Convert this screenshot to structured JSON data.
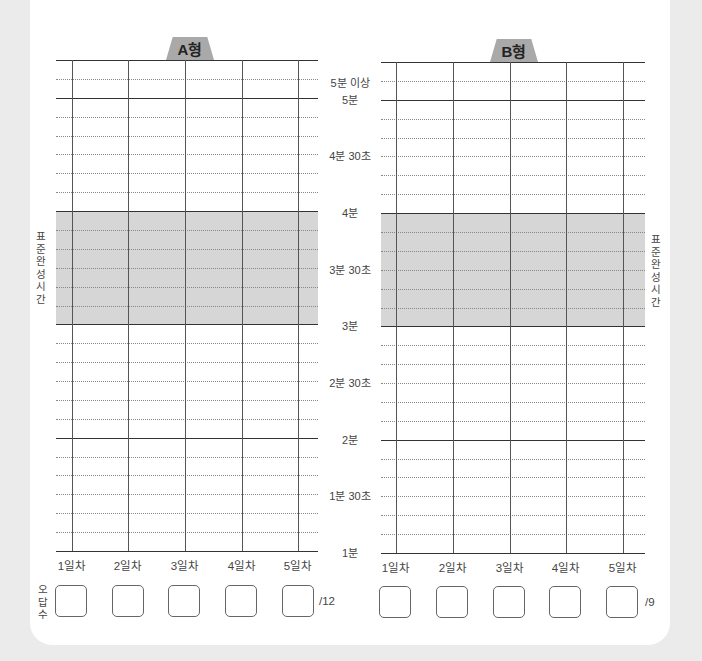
{
  "charts": [
    {
      "id": "A",
      "tab_label": "A형",
      "total_label": "/12",
      "day_labels": [
        "1일차",
        "2일차",
        "3일차",
        "4일차",
        "5일차"
      ],
      "answer_boxes": [
        "",
        "",
        "",
        "",
        ""
      ]
    },
    {
      "id": "B",
      "tab_label": "B형",
      "total_label": "/9",
      "day_labels": [
        "1일차",
        "2일차",
        "3일차",
        "4일차",
        "5일차"
      ],
      "answer_boxes": [
        "",
        "",
        "",
        "",
        ""
      ]
    }
  ],
  "y_labels": [
    "5분 이상",
    "5분",
    "4분 30초",
    "4분",
    "3분 30초",
    "3분",
    "2분 30초",
    "2분",
    "1분 30초",
    "1분"
  ],
  "standard_time_label": "표준완성시간",
  "wrong_answer_label": "오답수",
  "colors": {
    "background": "#ebebeb",
    "card": "#ffffff",
    "tab": "#a9a9a9",
    "standard_band": "#d6d6d6"
  }
}
